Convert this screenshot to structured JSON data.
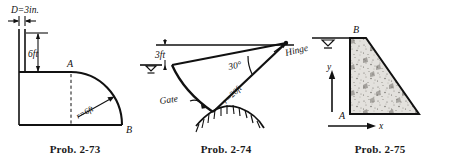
{
  "sheet": {
    "title": "Fluid statics problem figures 2-73, 2-74, 2-75",
    "background_color": "#ffffff",
    "ink_color": "#111111"
  },
  "figures": [
    {
      "id": "prob-2-73",
      "caption": "Prob. 2-73",
      "description": "Vertical pipe of diameter D attached to a tank with a quarter-circular curved surface from A to B",
      "labels": {
        "diameter": "D=3in.",
        "height": "6ft",
        "radius": "r=6ft",
        "point_a": "A",
        "point_b": "B"
      }
    },
    {
      "id": "prob-2-74",
      "caption": "Prob. 2-74",
      "description": "Curved circular gate hinged at upper right, submerged below a free surface",
      "labels": {
        "depth": "3ft",
        "angle": "30°",
        "radius": "r=20ft",
        "hinge": "Hinge",
        "gate": "Gate"
      }
    },
    {
      "id": "prob-2-75",
      "caption": "Prob. 2-75",
      "description": "Concrete gravity dam cross-section with water surface at crest B and base corner A, x-y axes at lower left",
      "labels": {
        "point_a": "A",
        "point_b": "B",
        "axis_x": "x",
        "axis_y": "y"
      }
    }
  ]
}
